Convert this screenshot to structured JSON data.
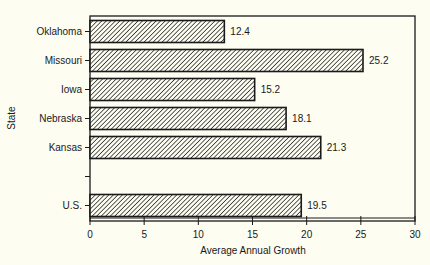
{
  "chart_data": {
    "type": "bar",
    "orientation": "horizontal",
    "title": "",
    "xlabel": "Average Annual Growth",
    "ylabel": "State",
    "categories": [
      "Oklahoma",
      "Missouri",
      "Iowa",
      "Nebraska",
      "Kansas",
      "",
      "U.S."
    ],
    "values": [
      12.4,
      25.2,
      15.2,
      18.1,
      21.3,
      null,
      19.5
    ],
    "value_labels": [
      "12.4",
      "25.2",
      "15.2",
      "18.1",
      "21.3",
      "",
      "19.5"
    ],
    "xlim": [
      0,
      30
    ],
    "xticks": [
      0,
      5,
      10,
      15,
      20,
      25,
      30
    ],
    "xtick_labels": [
      "0",
      "5",
      "10",
      "15",
      "20",
      "25",
      "30"
    ],
    "grid": false,
    "legend": null,
    "bar_fill": "diagonal-hatch",
    "colors": {
      "background": "#fdfdf2",
      "bar_stroke": "#1a1a1a",
      "hatch": "#1a1a1a"
    }
  }
}
